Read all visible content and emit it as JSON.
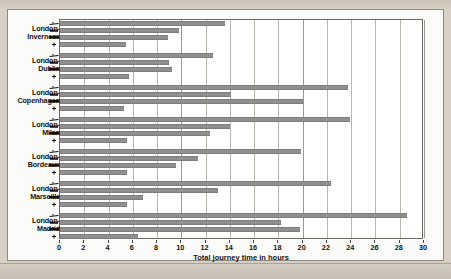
{
  "chart_data": {
    "type": "bar",
    "orientation": "horizontal",
    "title": "",
    "xlabel": "Total journey time in hours",
    "ylabel": "",
    "xlim": [
      0,
      30
    ],
    "xticks": [
      0,
      2,
      4,
      6,
      8,
      10,
      12,
      14,
      16,
      18,
      20,
      22,
      24,
      26,
      28,
      30
    ],
    "grid": true,
    "legend": "none",
    "bar_color": "#8b8b8b",
    "categories": [
      "London-Inverness",
      "London-Dublin",
      "London-Copenhagen",
      "London-Milan",
      "London-Bordeaux",
      "London-Marseille",
      "London-Madrid"
    ],
    "mode_icons": [
      "plane-icon",
      "train-icon",
      "coach-icon",
      "car-icon"
    ],
    "series": [
      {
        "name": "plane",
        "values": [
          13.6,
          12.6,
          23.7,
          23.9,
          19.9,
          22.3,
          28.6
        ]
      },
      {
        "name": "train",
        "values": [
          9.8,
          9.0,
          14.1,
          14.0,
          11.4,
          13.0,
          18.2
        ]
      },
      {
        "name": "coach",
        "values": [
          8.9,
          9.2,
          20.0,
          12.4,
          9.6,
          6.8,
          19.8
        ]
      },
      {
        "name": "car",
        "values": [
          5.4,
          5.7,
          5.3,
          5.5,
          5.5,
          5.5,
          6.4
        ]
      }
    ],
    "groups": [
      {
        "label_line1": "London-",
        "label_line2": "Inverness",
        "bars": [
          13.6,
          9.8,
          8.9,
          5.4
        ]
      },
      {
        "label_line1": "London-",
        "label_line2": "Dublin",
        "bars": [
          12.6,
          9.0,
          9.2,
          5.7
        ]
      },
      {
        "label_line1": "London-",
        "label_line2": "Copenhagen",
        "bars": [
          23.7,
          14.1,
          20.0,
          5.3
        ]
      },
      {
        "label_line1": "London-",
        "label_line2": "Milan",
        "bars": [
          23.9,
          14.0,
          12.4,
          5.5
        ]
      },
      {
        "label_line1": "London-",
        "label_line2": "Bordeaux",
        "bars": [
          19.9,
          11.4,
          9.6,
          5.5
        ]
      },
      {
        "label_line1": "London-",
        "label_line2": "Marseille",
        "bars": [
          22.3,
          13.0,
          6.8,
          5.5
        ]
      },
      {
        "label_line1": "London-",
        "label_line2": "Madrid",
        "bars": [
          28.6,
          18.2,
          19.8,
          6.4
        ]
      }
    ]
  },
  "axis": {
    "x_title": "Total journey time in hours"
  }
}
